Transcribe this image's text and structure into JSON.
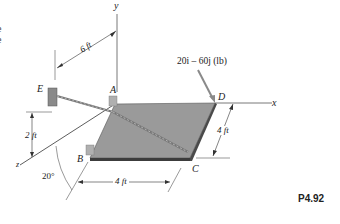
{
  "figure": {
    "problem_id": "P4.92",
    "force_label": "20i – 60j (lb)",
    "axes": {
      "x": "x",
      "y": "y",
      "z": "z"
    },
    "points": {
      "A": "A",
      "B": "B",
      "C": "C",
      "D": "D",
      "E": "E"
    },
    "dimensions": {
      "e_to_y_axis": "6 ft",
      "e_height": "2 ft",
      "plate_width_bc": "4 ft",
      "plate_depth_cd": "4 ft"
    },
    "angle": "20°",
    "cutoff_text": [
      "e",
      "e"
    ],
    "colors": {
      "plate_top": "#9a9a9a",
      "plate_edge": "#3c3c3c",
      "line": "#333333",
      "force_arrow": "#8a8a8a",
      "cable": "#7a7a7a"
    }
  }
}
